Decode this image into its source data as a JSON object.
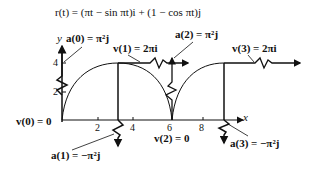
{
  "formula": "r(t) = (πt − sin πt)i + (1 − cos πt)j",
  "axes": {
    "x_label": "x",
    "y_label": "y",
    "x_ticks": [
      "2",
      "4",
      "6",
      "8"
    ],
    "y_ticks": [
      "4",
      "2"
    ]
  },
  "labels": {
    "v0": "v(0) = 0",
    "a0": "a(0) = π²j",
    "v1": "v(1) = 2πi",
    "a1": "a(1) = −π²j",
    "v2": "v(2) = 0",
    "a2": "a(2) = π²j",
    "v3": "v(3) = 2πi",
    "a3": "a(3) = −π²j"
  },
  "colors": {
    "ink": "#111111",
    "background": "#ffffff"
  }
}
